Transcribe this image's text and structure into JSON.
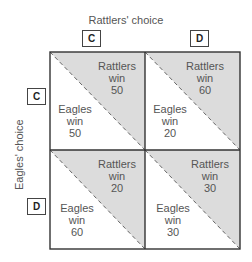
{
  "x_axis": {
    "label": "Rattlers' choice",
    "options": [
      "C",
      "D"
    ]
  },
  "y_axis": {
    "label": "Eagles' choice",
    "options": [
      "C",
      "D"
    ]
  },
  "cells": [
    {
      "row": "C",
      "col": "C",
      "rattlers": {
        "line1": "Rattlers",
        "line2": "win",
        "value": "50"
      },
      "eagles": {
        "line1": "Eagles",
        "line2": "win",
        "value": "50"
      }
    },
    {
      "row": "C",
      "col": "D",
      "rattlers": {
        "line1": "Rattlers",
        "line2": "win",
        "value": "60"
      },
      "eagles": {
        "line1": "Eagles",
        "line2": "win",
        "value": "20"
      }
    },
    {
      "row": "D",
      "col": "C",
      "rattlers": {
        "line1": "Rattlers",
        "line2": "win",
        "value": "20"
      },
      "eagles": {
        "line1": "Eagles",
        "line2": "win",
        "value": "60"
      }
    },
    {
      "row": "D",
      "col": "D",
      "rattlers": {
        "line1": "Rattlers",
        "line2": "win",
        "value": "30"
      },
      "eagles": {
        "line1": "Eagles",
        "line2": "win",
        "value": "30"
      }
    }
  ],
  "colors": {
    "shade": "#dcdcdc",
    "line": "#333333",
    "text": "#555555"
  }
}
